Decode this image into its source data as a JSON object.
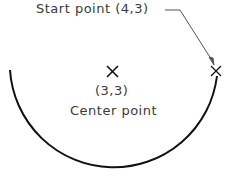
{
  "diagram": {
    "start_label": "Start point  (4,3)",
    "center_coord": "(3,3)",
    "center_label": "Center point",
    "colors": {
      "arc": "#111111",
      "text": "#3a3a3a",
      "leader": "#555555"
    }
  }
}
